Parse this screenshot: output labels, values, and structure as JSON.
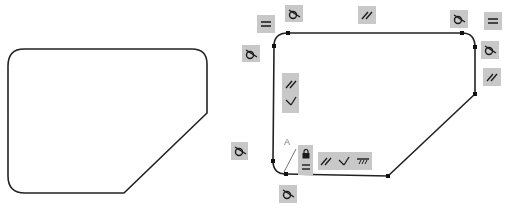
{
  "diagram": {
    "colors": {
      "stroke": "#222222",
      "badge_bg": "#c8c8c8",
      "glyph": "#1a1a1a"
    },
    "left_shape": {
      "name": "sketch-profile-plain"
    },
    "right_shape": {
      "name": "sketch-profile-constrained"
    },
    "dimension_label": "A",
    "constraints": [
      {
        "type": "equal",
        "symbol": "="
      },
      {
        "type": "tangent",
        "symbol": "tangent"
      },
      {
        "type": "parallel",
        "symbol": "//"
      },
      {
        "type": "tangent",
        "symbol": "tangent"
      },
      {
        "type": "equal",
        "symbol": "="
      },
      {
        "type": "tangent",
        "symbol": "tangent"
      },
      {
        "type": "tangent",
        "symbol": "tangent"
      },
      {
        "type": "parallel",
        "symbol": "//"
      },
      {
        "type": "parallel+perpendicular",
        "symbol": "// ⊥"
      },
      {
        "type": "tangent",
        "symbol": "tangent"
      },
      {
        "type": "fix+equal",
        "symbol": "lock ="
      },
      {
        "type": "parallel+perpendicular+horizontal",
        "symbol": "// ⊥ ground"
      },
      {
        "type": "tangent",
        "symbol": "tangent"
      }
    ]
  }
}
